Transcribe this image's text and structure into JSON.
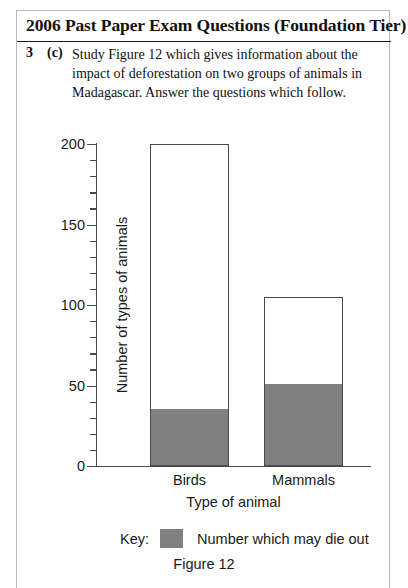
{
  "header": {
    "title": "2006 Past Paper Exam Questions (Foundation Tier)"
  },
  "question": {
    "number": "3",
    "part": "(c)",
    "text": "Study Figure 12 which gives information about the impact of deforestation on two groups of animals in Madagascar. Answer the questions which follow."
  },
  "chart_data": {
    "type": "bar",
    "stacked": true,
    "title": "",
    "categories": [
      "Birds",
      "Mammals"
    ],
    "series": [
      {
        "name": "Number which may die out",
        "values": [
          35,
          50
        ],
        "color": "#808080"
      },
      {
        "name": "Remaining",
        "values": [
          165,
          55
        ],
        "color": "#ffffff"
      }
    ],
    "totals": [
      200,
      105
    ],
    "xlabel": "Type of animal",
    "ylabel": "Number of types of animals",
    "ylim": [
      0,
      200
    ],
    "ytick_major": [
      0,
      50,
      100,
      150,
      200
    ],
    "ytick_major_labels": [
      "0",
      "50",
      "100",
      "150",
      "200"
    ],
    "ytick_minor_step": 10,
    "grid": false,
    "legend_position": "below"
  },
  "key": {
    "word": "Key:",
    "swatch_color": "#808080",
    "text": "Number which may die out"
  },
  "figure": {
    "caption": "Figure 12"
  }
}
